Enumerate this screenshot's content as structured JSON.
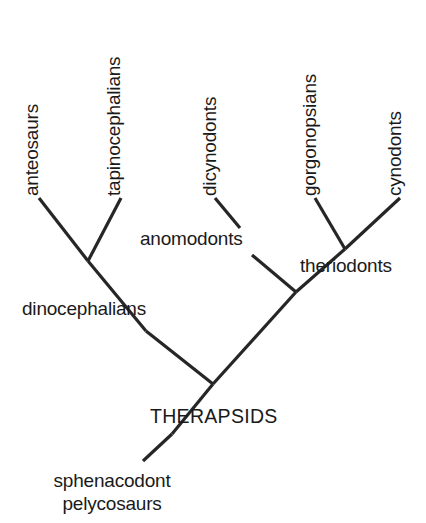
{
  "diagram": {
    "type": "cladogram",
    "background_color": "#ffffff",
    "line_color": "#262626",
    "text_color": "#1a1a1a"
  },
  "tip_labels": [
    {
      "id": "anteosaurs",
      "text": "anteosaurs",
      "orientation": "vertical",
      "x": 38,
      "y": 196
    },
    {
      "id": "tapinocephalians",
      "text": "tapinocephalians",
      "orientation": "vertical",
      "x": 120,
      "y": 196
    },
    {
      "id": "dicynodonts",
      "text": "dicynodonts",
      "orientation": "vertical",
      "x": 216,
      "y": 196
    },
    {
      "id": "gorgonopsians",
      "text": "gorgonopsians",
      "orientation": "vertical",
      "x": 316,
      "y": 196
    },
    {
      "id": "cynodonts",
      "text": "cynodonts",
      "orientation": "vertical",
      "x": 401,
      "y": 196
    }
  ],
  "node_labels": [
    {
      "id": "anomodonts",
      "text": "anomodonts",
      "orientation": "horizontal",
      "anchor": "start",
      "x": 140,
      "y": 245
    },
    {
      "id": "theriodonts",
      "text": "theriodonts",
      "orientation": "horizontal",
      "anchor": "start",
      "x": 300,
      "y": 272
    },
    {
      "id": "dinocephalians",
      "text": "dinocephalians",
      "orientation": "horizontal",
      "anchor": "start",
      "x": 22,
      "y": 315
    },
    {
      "id": "therapsids",
      "text": "THERAPSIDS",
      "orientation": "horizontal",
      "anchor": "start",
      "x": 150,
      "y": 423
    },
    {
      "id": "sphenacodont",
      "text": "sphenacodont",
      "orientation": "horizontal",
      "anchor": "middle",
      "x": 112,
      "y": 487
    },
    {
      "id": "pelycosaurs",
      "text": "pelycosaurs",
      "orientation": "horizontal",
      "anchor": "middle",
      "x": 112,
      "y": 510
    }
  ],
  "branches": [
    {
      "id": "branch-anteosaurs",
      "from_x": 39,
      "from_y": 198,
      "to_x": 88,
      "to_y": 261
    },
    {
      "id": "branch-tapinocephalians",
      "from_x": 121,
      "from_y": 198,
      "to_x": 88,
      "to_y": 261
    },
    {
      "id": "branch-dinocephalians-stem",
      "from_x": 88,
      "from_y": 261,
      "to_x": 146,
      "to_y": 331
    },
    {
      "id": "branch-dinocephalians-to-therapsids",
      "from_x": 146,
      "from_y": 331,
      "to_x": 213,
      "to_y": 384
    },
    {
      "id": "branch-dicynodonts",
      "from_x": 215,
      "from_y": 198,
      "to_x": 240,
      "to_y": 228
    },
    {
      "id": "branch-anomodonts-stem",
      "from_x": 252,
      "from_y": 255,
      "to_x": 296,
      "to_y": 292
    },
    {
      "id": "branch-gorgonopsians",
      "from_x": 315,
      "from_y": 198,
      "to_x": 345,
      "to_y": 249
    },
    {
      "id": "branch-cynodonts",
      "from_x": 400,
      "from_y": 198,
      "to_x": 345,
      "to_y": 249
    },
    {
      "id": "branch-theriodonts-stem",
      "from_x": 345,
      "from_y": 249,
      "to_x": 296,
      "to_y": 292
    },
    {
      "id": "branch-crown-to-therapsids",
      "from_x": 296,
      "from_y": 292,
      "to_x": 213,
      "to_y": 384
    },
    {
      "id": "branch-therapsids-stem",
      "from_x": 213,
      "from_y": 384,
      "to_x": 172,
      "to_y": 434
    },
    {
      "id": "branch-pelycosaur-root",
      "from_x": 172,
      "from_y": 434,
      "to_x": 143,
      "to_y": 461
    }
  ]
}
